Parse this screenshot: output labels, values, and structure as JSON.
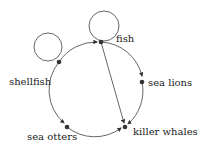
{
  "diagram": {
    "type": "directed-graph",
    "nodes": [
      {
        "id": "fish",
        "label": "fish"
      },
      {
        "id": "shellfish",
        "label": "shellfish"
      },
      {
        "id": "sea_lions",
        "label": "sea lions"
      },
      {
        "id": "killer_whales",
        "label": "killer whales"
      },
      {
        "id": "sea_otters",
        "label": "sea otters"
      }
    ],
    "edges": [
      {
        "from": "shellfish",
        "to": "shellfish",
        "kind": "self-loop"
      },
      {
        "from": "fish",
        "to": "fish",
        "kind": "self-loop"
      },
      {
        "from": "shellfish",
        "to": "fish"
      },
      {
        "from": "fish",
        "to": "sea_lions"
      },
      {
        "from": "sea_lions",
        "to": "killer_whales"
      },
      {
        "from": "fish",
        "to": "killer_whales"
      },
      {
        "from": "sea_otters",
        "to": "killer_whales"
      },
      {
        "from": "shellfish",
        "to": "sea_otters"
      }
    ],
    "colors": {
      "edge": "#555555",
      "node": "#333333",
      "text": "#222222"
    }
  }
}
